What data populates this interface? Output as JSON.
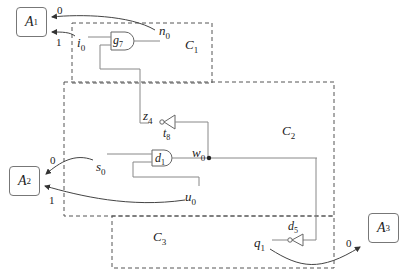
{
  "diagram": {
    "type": "circuit-partition",
    "agents": [
      {
        "id": "A1",
        "base": "A",
        "sub": "1"
      },
      {
        "id": "A2",
        "base": "A",
        "sub": "2"
      },
      {
        "id": "A3",
        "base": "A",
        "sub": "3"
      }
    ],
    "clusters": [
      {
        "id": "C1",
        "base": "C",
        "sub": "1"
      },
      {
        "id": "C2",
        "base": "C",
        "sub": "2"
      },
      {
        "id": "C3",
        "base": "C",
        "sub": "3"
      }
    ],
    "gates": [
      {
        "id": "g7",
        "base": "g",
        "sub": "7",
        "kind": "AND"
      },
      {
        "id": "d1",
        "base": "d",
        "sub": "1",
        "kind": "AND"
      },
      {
        "id": "t8",
        "base": "t",
        "sub": "8",
        "kind": "NOT"
      },
      {
        "id": "d5",
        "base": "d",
        "sub": "5",
        "kind": "NOT"
      }
    ],
    "wires": [
      {
        "id": "n0",
        "base": "n",
        "sub": "0"
      },
      {
        "id": "i0",
        "base": "i",
        "sub": "0"
      },
      {
        "id": "z4",
        "base": "z",
        "sub": "4"
      },
      {
        "id": "w0",
        "base": "w",
        "sub": "0"
      },
      {
        "id": "s0",
        "base": "s",
        "sub": "0"
      },
      {
        "id": "u0",
        "base": "u",
        "sub": "0"
      },
      {
        "id": "q1",
        "base": "q",
        "sub": "1"
      }
    ],
    "edges": [
      {
        "from": "n0",
        "to": "A1",
        "label": "0"
      },
      {
        "from": "i0",
        "to": "A1",
        "label": "1"
      },
      {
        "from": "s0",
        "to": "A2",
        "label": "0"
      },
      {
        "from": "u0",
        "to": "A2",
        "label": "1"
      },
      {
        "from": "q1",
        "to": "A3",
        "label": "0"
      }
    ]
  }
}
